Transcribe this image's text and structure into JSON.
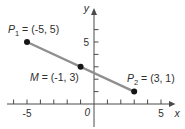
{
  "figure": {
    "colors": {
      "background": "#ffffff",
      "axis": "#4a4a4a",
      "segment": "#8f8f8f",
      "point": "#161616",
      "text": "#2e2e2e"
    }
  },
  "chart_data": {
    "type": "scatter",
    "title": "",
    "xlabel": "x",
    "ylabel": "y",
    "origin_label": "0",
    "xlim": [
      -6.5,
      6.1
    ],
    "ylim": [
      -1.9,
      7.7
    ],
    "grid": false,
    "legend": false,
    "x_ticks": [
      -6,
      -5,
      -4,
      -3,
      -2,
      -1,
      1,
      2,
      3,
      4,
      5
    ],
    "x_tick_labels": [
      {
        "value": -5,
        "label": "-5"
      },
      {
        "value": 5,
        "label": "5"
      }
    ],
    "y_ticks": [
      1,
      2,
      3,
      4,
      5,
      6
    ],
    "y_tick_labels": [
      {
        "value": 5,
        "label": "5"
      }
    ],
    "points": [
      {
        "name": "P",
        "sub": "1",
        "eq": " = (-5, 5)",
        "x": -5,
        "y": 5
      },
      {
        "name": "M",
        "sub": "",
        "eq": " = (-1, 3)",
        "x": -1,
        "y": 3
      },
      {
        "name": "P",
        "sub": "2",
        "eq": " = (3, 1)",
        "x": 3,
        "y": 1
      }
    ],
    "segments": [
      {
        "from": 0,
        "to": 2
      }
    ]
  }
}
